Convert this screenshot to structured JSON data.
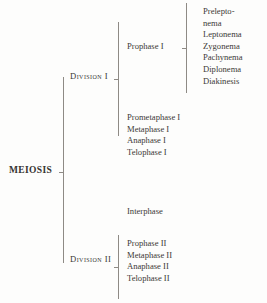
{
  "diagram": {
    "title": "MEIOSIS",
    "type": "hierarchical-bracket-tree",
    "root": {
      "label": "MEIOSIS"
    },
    "divisions": [
      {
        "label": "Division I",
        "groups": [
          {
            "label": "Prophase I",
            "substages": [
              "Prelepto-",
              "nema",
              "Leptonema",
              "Zygonema",
              "Pachynema",
              "Diplonema",
              "Diakinesis"
            ]
          },
          {
            "label": "",
            "items": [
              "Prometaphase I",
              "Metaphase I",
              "Anaphase I",
              "Telophase I"
            ]
          }
        ]
      },
      {
        "label": "Interphase",
        "standalone": true
      },
      {
        "label": "Division II",
        "groups": [
          {
            "label": "",
            "items": [
              "Prophase II",
              "Metaphase II",
              "Anaphase II",
              "Telophase II"
            ]
          }
        ]
      }
    ],
    "colors": {
      "text": "#3c3936",
      "rule": "#8e8a85",
      "background": "#fdfdfc"
    }
  }
}
